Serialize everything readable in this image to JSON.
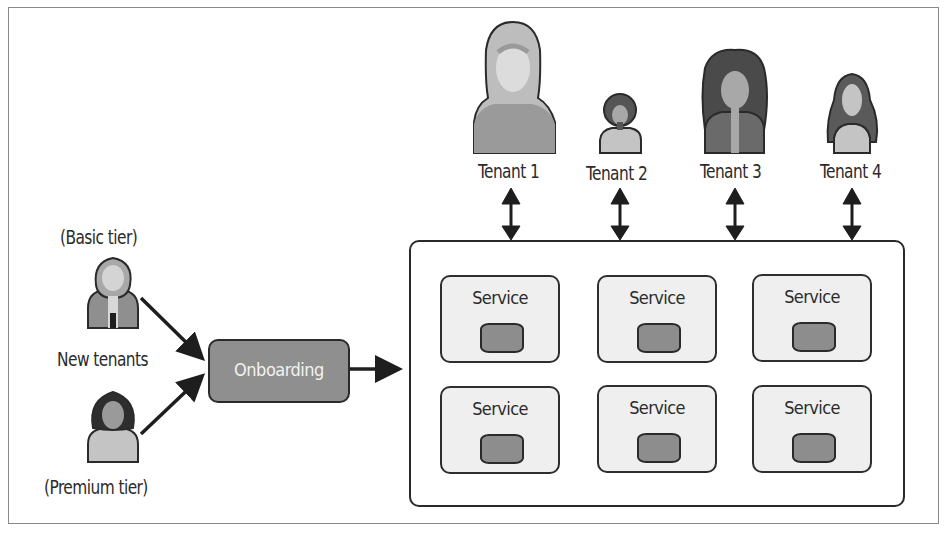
{
  "diagram": {
    "new_tenants": {
      "label": "New tenants",
      "basic_tier_label": "(Basic tier)",
      "premium_tier_label": "(Premium tier)"
    },
    "onboarding": {
      "label": "Onboarding"
    },
    "tenants": [
      {
        "label": "Tenant 1"
      },
      {
        "label": "Tenant 2"
      },
      {
        "label": "Tenant 3"
      },
      {
        "label": "Tenant 4"
      }
    ],
    "services": [
      {
        "label": "Service"
      },
      {
        "label": "Service"
      },
      {
        "label": "Service"
      },
      {
        "label": "Service"
      },
      {
        "label": "Service"
      },
      {
        "label": "Service"
      }
    ],
    "colors": {
      "box_fill": "#8f8f8f",
      "service_fill": "#efefef",
      "database_fill": "#8d8d8d",
      "stroke": "#2a2a2a"
    }
  }
}
